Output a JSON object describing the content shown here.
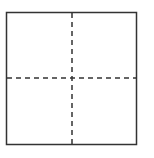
{
  "diagram": {
    "type": "square-with-crosshair",
    "box": {
      "x": 6.5,
      "y": 12.5,
      "width": 130,
      "height": 132
    },
    "center": {
      "x": 72,
      "y": 78
    },
    "colors": {
      "stroke": "#333333",
      "dash": "#333333",
      "background": "#ffffff"
    },
    "stroke_width": 1.5,
    "dash_pattern": "5,4"
  }
}
